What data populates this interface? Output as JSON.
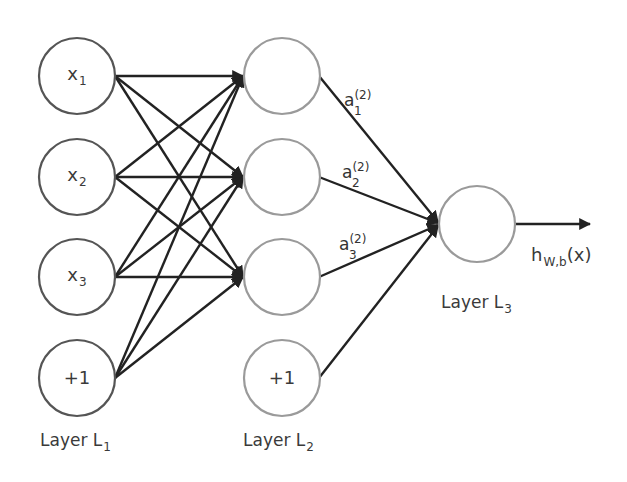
{
  "diagram": {
    "layers": [
      {
        "label": "Layer L",
        "label_sub": "1",
        "nodes": [
          {
            "text": "x",
            "sub": "1"
          },
          {
            "text": "x",
            "sub": "2"
          },
          {
            "text": "x",
            "sub": "3"
          },
          {
            "text": "+1",
            "sub": ""
          }
        ]
      },
      {
        "label": "Layer L",
        "label_sub": "2",
        "nodes": [
          {
            "text": "",
            "sub": ""
          },
          {
            "text": "",
            "sub": ""
          },
          {
            "text": "",
            "sub": ""
          },
          {
            "text": "+1",
            "sub": ""
          }
        ]
      },
      {
        "label": "Layer L",
        "label_sub": "3",
        "nodes": [
          {
            "text": "",
            "sub": ""
          }
        ]
      }
    ],
    "activations": [
      {
        "base": "a",
        "sup": "(2)",
        "sub": "1"
      },
      {
        "base": "a",
        "sup": "(2)",
        "sub": "2"
      },
      {
        "base": "a",
        "sup": "(2)",
        "sub": "3"
      }
    ],
    "output": {
      "base": "h",
      "sub": "W,b",
      "arg": "(x)"
    },
    "colors": {
      "input_node_stroke": "#555555",
      "hidden_node_stroke": "#9a9a9a",
      "edge": "#222222",
      "text": "#3a3a3a"
    }
  }
}
